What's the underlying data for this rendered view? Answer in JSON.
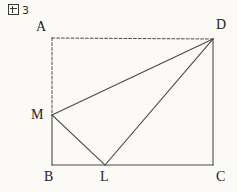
{
  "figure": {
    "caption_mark": "図",
    "caption_number": "3",
    "background_color": "#fbfaf7",
    "stroke_color": "#4a4a4a",
    "label_color": "#222222"
  },
  "geometry": {
    "type": "plane-geometry-diagram",
    "shape": "rectangle-with-inscribed-triangle",
    "viewbox": "0 0 237 192",
    "points": {
      "A": {
        "label": "A",
        "x": 52,
        "y": 38,
        "label_x": 36,
        "label_y": 20
      },
      "B": {
        "label": "B",
        "x": 52,
        "y": 165,
        "label_x": 44,
        "label_y": 170
      },
      "C": {
        "label": "C",
        "x": 213,
        "y": 165,
        "label_x": 216,
        "label_y": 170
      },
      "D": {
        "label": "D",
        "x": 213,
        "y": 39,
        "label_x": 216,
        "label_y": 18
      },
      "L": {
        "label": "L",
        "x": 105,
        "y": 165,
        "label_x": 100,
        "label_y": 170
      },
      "M": {
        "label": "M",
        "x": 52,
        "y": 115,
        "label_x": 31,
        "label_y": 108
      }
    },
    "segments": [
      {
        "name": "AD",
        "from": "A",
        "to": "D",
        "style": "dashed"
      },
      {
        "name": "AM",
        "from": "A",
        "to": "M",
        "style": "dashed"
      },
      {
        "name": "MB",
        "from": "M",
        "to": "B",
        "style": "solid"
      },
      {
        "name": "BC",
        "from": "B",
        "to": "C",
        "style": "solid"
      },
      {
        "name": "DC",
        "from": "D",
        "to": "C",
        "style": "solid"
      },
      {
        "name": "MD",
        "from": "M",
        "to": "D",
        "style": "solid"
      },
      {
        "name": "ML",
        "from": "M",
        "to": "L",
        "style": "solid"
      },
      {
        "name": "LD",
        "from": "L",
        "to": "D",
        "style": "solid"
      }
    ]
  }
}
